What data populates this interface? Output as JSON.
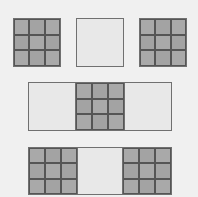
{
  "diagram": {
    "title": "",
    "colors": {
      "background": "#f0f0f0",
      "grid_fill": "#a8a8a8",
      "blank_fill": "#e8e8e8",
      "border": "#707070",
      "grid_lines": "#555555"
    },
    "rows": [
      {
        "name": "top-row",
        "shapes": [
          {
            "type": "grid3x3",
            "x": 13,
            "y": 18,
            "w": 48,
            "h": 49
          },
          {
            "type": "blank",
            "x": 76,
            "y": 18,
            "w": 48,
            "h": 49
          },
          {
            "type": "grid3x3",
            "x": 139,
            "y": 18,
            "w": 48,
            "h": 49
          }
        ]
      },
      {
        "name": "middle-row",
        "shapes": [
          {
            "type": "composite",
            "x": 28,
            "y": 82,
            "w": 144,
            "h": 49,
            "segments": [
              "blank",
              "grid3x3",
              "blank"
            ]
          }
        ]
      },
      {
        "name": "bottom-row",
        "shapes": [
          {
            "type": "composite",
            "x": 28,
            "y": 147,
            "w": 144,
            "h": 48,
            "segments": [
              "grid3x3",
              "blank",
              "grid3x3"
            ]
          }
        ]
      }
    ]
  }
}
